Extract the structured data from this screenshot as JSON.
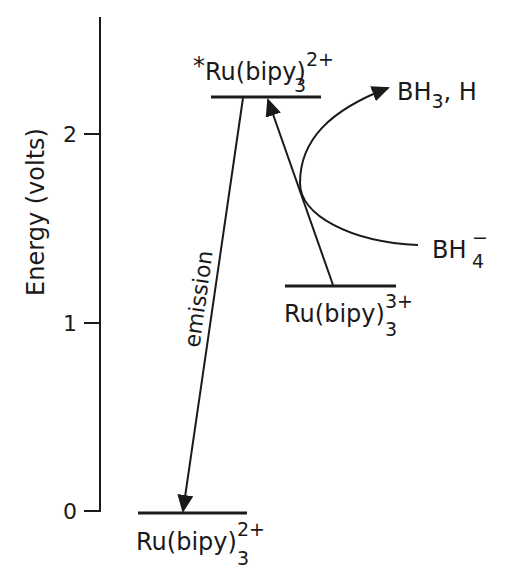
{
  "diagram": {
    "type": "energy-level diagram",
    "axis": {
      "label": "Energy (volts)",
      "ticks": [
        {
          "value": 0,
          "label": "0"
        },
        {
          "value": 1,
          "label": "1"
        },
        {
          "value": 2,
          "label": "2"
        }
      ]
    },
    "levels": {
      "excited": {
        "star": "*",
        "base": "Ru(bipy)",
        "sub": "3",
        "sup": "2+",
        "energy": 2.2
      },
      "oxidized": {
        "base": "Ru(bipy)",
        "sub": "3",
        "sup": "3+",
        "energy": 1.2
      },
      "ground": {
        "base": "Ru(bipy)",
        "sub": "3",
        "sup": "2+",
        "energy": 0
      }
    },
    "arrows": {
      "emission_label": "emission"
    },
    "reactants": {
      "bh4": {
        "base": "BH",
        "sub": "4",
        "sup": "−"
      },
      "products": {
        "base": "BH",
        "sub": "3",
        "tail": ", H"
      }
    },
    "colors": {
      "ink": "#1a1a1a",
      "background": "#ffffff"
    }
  }
}
